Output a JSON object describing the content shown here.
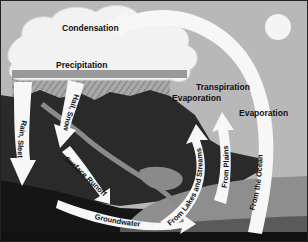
{
  "diagram": {
    "labels": {
      "condensation": "Condensation",
      "precipitation": "Precipitation",
      "rain_sleet": "Rain, Sleet",
      "hail_snow": "Hail, Snow",
      "surface_runoff": "Surface Runoff",
      "groundwater": "Groundwater",
      "evaporation_lakes": "Evaporation",
      "from_lakes": "From Lakes and Streams",
      "transpiration": "Transpiration",
      "from_plains": "From Plains",
      "evaporation_ocean": "Evaporation",
      "from_ocean": "From the Ocean"
    },
    "colors": {
      "sky": "#b8b8b8",
      "cloud": "#f2f2f2",
      "sun": "#f4f4f4",
      "land": "#2a2a2a",
      "ground": "#151515",
      "ocean_light": "#8e8e8e",
      "ocean_mid": "#5a5a5a",
      "river": "#8a8a8a",
      "arrow": "#f7f7f7",
      "rain_hatch": "#8c8c8c"
    }
  }
}
